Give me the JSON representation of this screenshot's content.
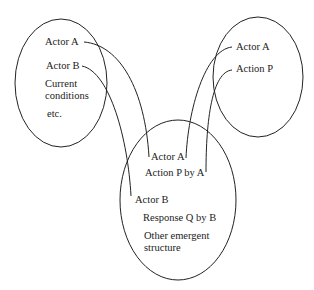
{
  "diagram": {
    "left_circle": {
      "items": [
        "Actor A",
        "Actor B",
        "Current",
        "conditions",
        "etc."
      ]
    },
    "right_circle": {
      "items": [
        "Actor A",
        "Action P"
      ]
    },
    "bottom_circle": {
      "items": [
        "Actor A",
        "Action P by A",
        "Actor B",
        "Response Q by B",
        "Other emergent",
        "structure"
      ]
    },
    "colors": {
      "stroke": "#222222",
      "background": "#ffffff"
    }
  }
}
